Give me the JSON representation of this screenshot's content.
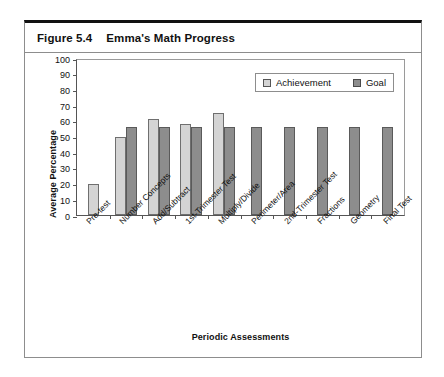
{
  "figure": {
    "label": "Figure 5.4",
    "title": "Emma's Math Progress"
  },
  "chart_data": {
    "type": "bar",
    "title": "Emma's Math Progress",
    "xlabel": "Periodic Assessments",
    "ylabel": "Average Percentage",
    "ylim": [
      0,
      100
    ],
    "ytick_step": 10,
    "yticks": [
      100,
      90,
      80,
      70,
      60,
      50,
      40,
      30,
      20,
      10,
      0
    ],
    "grid": false,
    "legend_position": "top-right",
    "categories": [
      "Pre-test",
      "Number Concepts",
      "Add/Subtract",
      "1st-Trimester Test",
      "Multiply/Divide",
      "Perimeter/Area",
      "2nd-Trimester Test",
      "Fractions",
      "Geometry",
      "Final Test"
    ],
    "series": [
      {
        "name": "Achievement",
        "color": "#d4d4d4",
        "values": [
          20,
          50,
          61,
          58,
          65,
          null,
          null,
          null,
          null,
          null
        ]
      },
      {
        "name": "Goal",
        "color": "#8d8d8d",
        "values": [
          null,
          56,
          56,
          56,
          56,
          56,
          56,
          56,
          56,
          56
        ]
      }
    ]
  }
}
